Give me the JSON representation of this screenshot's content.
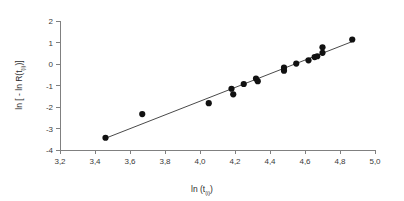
{
  "chart_data": {
    "type": "scatter",
    "title": "",
    "subtitle": "",
    "xlabel": "ln (t",
    "xlabel_sub": "(i)",
    "xlabel_tail": ")",
    "ylabel_pre": "ln [ - ln R(t",
    "ylabel_sub": "(i)",
    "ylabel_tail": ")]",
    "xlabel_full": "ln (t(i))",
    "ylabel_full": "ln [ - ln R(t(i))]",
    "xlim": [
      3.2,
      5.0
    ],
    "ylim": [
      -4,
      2
    ],
    "xticks": [
      3.2,
      3.4,
      3.6,
      3.8,
      4.0,
      4.2,
      4.4,
      4.6,
      4.8,
      5.0
    ],
    "yticks": [
      -4,
      -3,
      -2,
      -1,
      0,
      1,
      2
    ],
    "xticklabels": [
      "3,2",
      "3,4",
      "3,6",
      "3,8",
      "4,0",
      "4,2",
      "4,4",
      "4,6",
      "4,8",
      "5,0"
    ],
    "yticklabels": [
      "-4",
      "-3",
      "-2",
      "-1",
      "0",
      "1",
      "2"
    ],
    "decimal_separator": ",",
    "grid": false,
    "legend": false,
    "legend_position": "none",
    "marker": "filled-circle",
    "marker_color": "#111111",
    "marker_size_px": 3.1,
    "line_color": "#4a4a4a",
    "axis_color": "#808080",
    "background": "#ffffff",
    "x": [
      3.46,
      3.67,
      4.05,
      4.18,
      4.19,
      4.25,
      4.32,
      4.33,
      4.48,
      4.48,
      4.55,
      4.62,
      4.655,
      4.67,
      4.7,
      4.7,
      4.87
    ],
    "y": [
      -3.43,
      -2.33,
      -1.82,
      -1.15,
      -1.41,
      -0.93,
      -0.68,
      -0.8,
      -0.17,
      -0.31,
      0.02,
      0.17,
      0.32,
      0.36,
      0.78,
      0.52,
      1.14
    ],
    "points": [
      {
        "x": 3.46,
        "y": -3.43
      },
      {
        "x": 3.67,
        "y": -2.33
      },
      {
        "x": 4.05,
        "y": -1.82
      },
      {
        "x": 4.18,
        "y": -1.15
      },
      {
        "x": 4.19,
        "y": -1.41
      },
      {
        "x": 4.25,
        "y": -0.93
      },
      {
        "x": 4.32,
        "y": -0.68
      },
      {
        "x": 4.33,
        "y": -0.8
      },
      {
        "x": 4.48,
        "y": -0.17
      },
      {
        "x": 4.48,
        "y": -0.31
      },
      {
        "x": 4.55,
        "y": 0.02
      },
      {
        "x": 4.62,
        "y": 0.17
      },
      {
        "x": 4.655,
        "y": 0.32
      },
      {
        "x": 4.67,
        "y": 0.36
      },
      {
        "x": 4.7,
        "y": 0.78
      },
      {
        "x": 4.7,
        "y": 0.52
      },
      {
        "x": 4.87,
        "y": 1.14
      }
    ],
    "trendline": {
      "type": "linear-fit",
      "x_start": 3.455,
      "y_start": -3.47,
      "x_end": 4.875,
      "y_end": 1.06
    }
  }
}
